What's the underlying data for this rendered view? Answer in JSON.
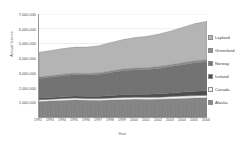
{
  "axis": {
    "y_title": "Annual Visitors",
    "x_title": "Year",
    "y_ticks": [
      "7,000,000",
      "6,000,000",
      "5,000,000",
      "4,000,000",
      "3,000,000",
      "2,000,000",
      "1,000,000"
    ],
    "x_ticks": [
      "1992",
      "1993",
      "1994",
      "1995",
      "1996",
      "1997",
      "1998",
      "1999",
      "2000",
      "2001",
      "2002",
      "2003",
      "2004",
      "2005",
      "2006"
    ]
  },
  "legend": {
    "items": [
      {
        "label": "Lapland",
        "color": "#b4b4b4"
      },
      {
        "label": "Greenland",
        "color": "#8e8e8e"
      },
      {
        "label": "Norway",
        "color": "#767676"
      },
      {
        "label": "Iceland",
        "color": "#4f4f4f"
      },
      {
        "label": "Canada",
        "color": "#f2f2f2"
      },
      {
        "label": "Alaska",
        "color": "#8a8a8a"
      }
    ]
  },
  "chart_data": {
    "type": "area",
    "title": "",
    "xlabel": "Year",
    "ylabel": "Annual Visitors",
    "stacked": true,
    "grid": true,
    "legend_position": "right",
    "xlim": [
      1992,
      2006
    ],
    "ylim": [
      0,
      7000000
    ],
    "ytick_step": 1000000,
    "categories": [
      1992,
      1993,
      1994,
      1995,
      1996,
      1997,
      1998,
      1999,
      2000,
      2001,
      2002,
      2003,
      2004,
      2005,
      2006
    ],
    "stack_order_bottom_to_top": [
      "Alaska",
      "Canada",
      "Iceland",
      "Norway",
      "Greenland",
      "Lapland"
    ],
    "series": [
      {
        "name": "Alaska",
        "color": "#8a8a8a",
        "values": [
          1050000,
          1080000,
          1120000,
          1150000,
          1130000,
          1120000,
          1150000,
          1180000,
          1200000,
          1190000,
          1200000,
          1230000,
          1260000,
          1290000,
          1300000
        ]
      },
      {
        "name": "Canada",
        "color": "#f2f2f2",
        "values": [
          130000,
          130000,
          135000,
          135000,
          130000,
          130000,
          135000,
          140000,
          145000,
          145000,
          150000,
          155000,
          160000,
          165000,
          170000
        ]
      },
      {
        "name": "Iceland",
        "color": "#4f4f4f",
        "values": [
          110000,
          120000,
          130000,
          140000,
          150000,
          160000,
          175000,
          190000,
          205000,
          215000,
          230000,
          250000,
          275000,
          300000,
          320000
        ]
      },
      {
        "name": "Norway",
        "color": "#767676",
        "values": [
          1330000,
          1370000,
          1420000,
          1450000,
          1440000,
          1480000,
          1560000,
          1630000,
          1660000,
          1680000,
          1720000,
          1790000,
          1860000,
          1930000,
          1960000
        ]
      },
      {
        "name": "Greenland",
        "color": "#8e8e8e",
        "values": [
          90000,
          95000,
          95000,
          100000,
          100000,
          105000,
          110000,
          115000,
          120000,
          120000,
          125000,
          130000,
          135000,
          140000,
          145000
        ]
      },
      {
        "name": "Lapland",
        "color": "#b4b4b4",
        "values": [
          1690000,
          1725000,
          1750000,
          1775000,
          1800000,
          1855000,
          1930000,
          2005000,
          2070000,
          2130000,
          2215000,
          2295000,
          2410000,
          2525000,
          2605000
        ]
      }
    ],
    "totals": [
      4400000,
      4520000,
      4650000,
      4750000,
      4750000,
      4850000,
      5060000,
      5260000,
      5400000,
      5480000,
      5640000,
      5850000,
      6100000,
      6350000,
      6500000
    ]
  }
}
